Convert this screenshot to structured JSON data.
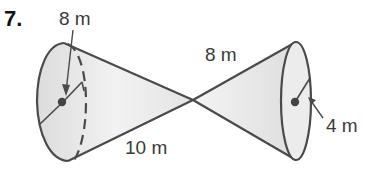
{
  "problem": {
    "number": "7.",
    "shape": "double-cone"
  },
  "labels": {
    "left_radius": "8 m",
    "right_slant": "8 m",
    "left_slant": "10 m",
    "right_radius": "4 m"
  },
  "colors": {
    "stroke": "#4a4a4a",
    "fill": "#e6e6e6",
    "text": "#3a3a3a"
  }
}
